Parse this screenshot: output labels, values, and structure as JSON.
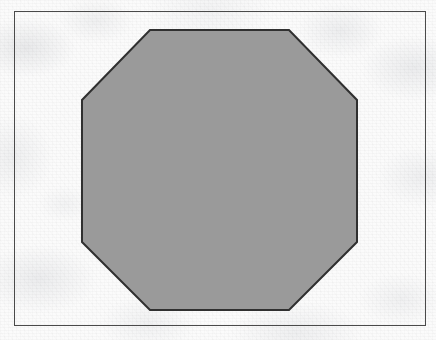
{
  "figure": {
    "title": "Regular octagon filled with gray on a bordered white sheet",
    "caption": "",
    "canvas": {
      "width": 436,
      "height": 340
    },
    "medium": "scanned paper",
    "background_color": "#fbfbfb"
  },
  "border_frame": {
    "label": "figure border rectangle",
    "x": 14,
    "y": 11,
    "width": 411,
    "height": 314,
    "stroke_color": "#4a4a4a",
    "stroke_width": 1,
    "fill_color": "none"
  },
  "shape": {
    "label": "Octagon",
    "type": "octagon",
    "sides": 8,
    "regular": true,
    "fill_color": "#9a9a9a",
    "stroke_color": "#303030",
    "stroke_width": 2,
    "bounding_box": {
      "x": 82,
      "y": 30,
      "width": 275,
      "height": 280
    },
    "center": {
      "x": 219.5,
      "y": 170
    },
    "vertices": [
      {
        "index": 1,
        "name": "top-left",
        "x": 150,
        "y": 30
      },
      {
        "index": 2,
        "name": "top-right",
        "x": 289,
        "y": 30
      },
      {
        "index": 3,
        "name": "right-top",
        "x": 357,
        "y": 100
      },
      {
        "index": 4,
        "name": "right-bottom",
        "x": 357,
        "y": 242
      },
      {
        "index": 5,
        "name": "bottom-right",
        "x": 289,
        "y": 310
      },
      {
        "index": 6,
        "name": "bottom-left",
        "x": 150,
        "y": 310
      },
      {
        "index": 7,
        "name": "left-bottom",
        "x": 82,
        "y": 242
      },
      {
        "index": 8,
        "name": "left-top",
        "x": 82,
        "y": 100
      }
    ],
    "points_attr": "150,30 289,30 357,100 357,242 289,310 150,310 82,242 82,100"
  },
  "chart_data": {
    "type": "diagram",
    "title": "Regular octagon",
    "shapes": [
      {
        "kind": "rectangle",
        "role": "frame",
        "x": 14,
        "y": 11,
        "width": 411,
        "height": 314,
        "fill": "none",
        "stroke": "#4a4a4a"
      },
      {
        "kind": "polygon",
        "role": "octagon",
        "sides": 8,
        "fill": "#9a9a9a",
        "stroke": "#303030",
        "vertices": [
          [
            150,
            30
          ],
          [
            289,
            30
          ],
          [
            357,
            100
          ],
          [
            357,
            242
          ],
          [
            289,
            310
          ],
          [
            150,
            310
          ],
          [
            82,
            242
          ],
          [
            82,
            100
          ]
        ]
      }
    ],
    "xlabel": "",
    "ylabel": "",
    "grid": false,
    "legend": false
  }
}
